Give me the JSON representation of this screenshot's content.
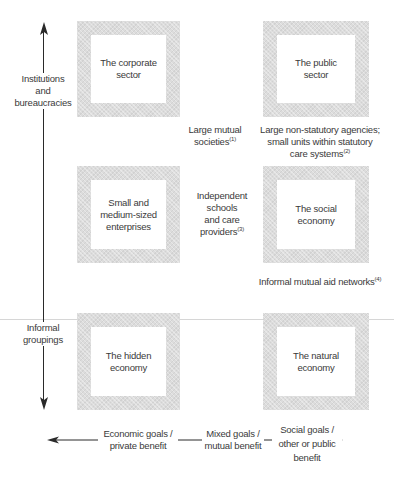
{
  "boxes": {
    "corporate": "The corporate\nsector",
    "public": "The public\nsector",
    "sme": "Small and\nmedium-sized\nenterprises",
    "social": "The social\neconomy",
    "hidden": "The hidden\neconomy",
    "natural": "The natural\neconomy"
  },
  "intermediate": {
    "mutual_societies": {
      "text": "Large mutual\nsocieties",
      "note": "(1)"
    },
    "non_statutory": {
      "text": "Large non-statutory agencies;\nsmall units within statutory\ncare systems",
      "note": "(2)"
    },
    "independent": {
      "text": "Independent\nschools\nand care\nproviders",
      "note": "(3)"
    },
    "informal_networks": {
      "text": "Informal mutual aid networks",
      "note": "(4)"
    }
  },
  "vertical_axis": {
    "top_label": "Institutions\nand\nbureaucracies",
    "bottom_label": "Informal\ngroupings"
  },
  "horizontal_axis": {
    "left_label": "Economic goals /\nprivate benefit",
    "middle_label": "Mixed goals /\nmutual benefit",
    "right_label": "Social goals /\nother or public\nbenefit"
  },
  "colors": {
    "frame": "#dcdcdc",
    "text": "#3a3a3a",
    "axis": "#2a2a2a",
    "divider": "#d6d6d6"
  }
}
